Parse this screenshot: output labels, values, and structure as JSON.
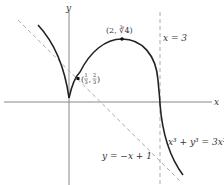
{
  "figure": {
    "axes": {
      "x_label": "x",
      "y_label": "y"
    },
    "curve": {
      "equation": "x³ + y³ = 3x²",
      "color": "#222222"
    },
    "asymptote_slant": {
      "equation": "y = −x + 1",
      "style": "dashed",
      "color": "#999999"
    },
    "asymptote_vertical": {
      "equation": "x = 3",
      "style": "dashed",
      "color": "#999999"
    },
    "points": [
      {
        "label": "(2, ∛4)",
        "label_display": "(2, ∛4)",
        "x": 2,
        "y": 1.587
      },
      {
        "label": "(1/3, 2/3)",
        "frac1_num": "1",
        "frac1_den": "3",
        "frac2_num": "2",
        "frac2_den": "3",
        "x": 0.333,
        "y": 0.667
      }
    ]
  }
}
